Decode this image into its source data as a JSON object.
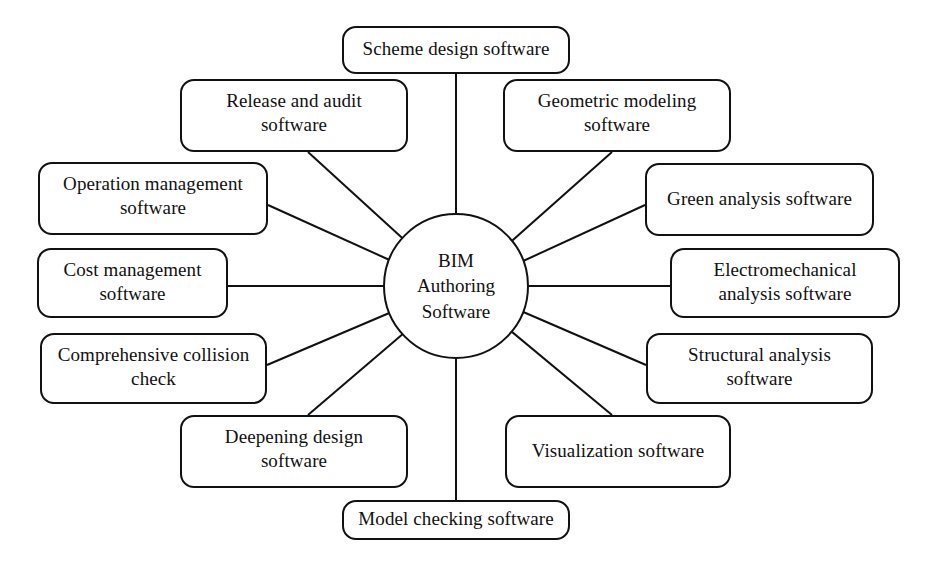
{
  "diagram": {
    "type": "hub-and-spoke",
    "title_shown": false,
    "background_color": "#ffffff",
    "stroke_color": "#111111",
    "text_color": "#111111",
    "center": {
      "label": "BIM\nAuthoring\nSoftware",
      "shape": "circle"
    },
    "nodes": [
      {
        "id": "scheme-design-software",
        "label": "Scheme design software",
        "lines": 1,
        "x": 342,
        "y": 26,
        "w": 228,
        "h": 48
      },
      {
        "id": "release-and-audit-software",
        "label": "Release and audit\nsoftware",
        "lines": 2,
        "x": 180,
        "y": 79,
        "w": 228,
        "h": 73
      },
      {
        "id": "geometric-modeling-software",
        "label": "Geometric modeling\nsoftware",
        "lines": 2,
        "x": 503,
        "y": 79,
        "w": 228,
        "h": 73
      },
      {
        "id": "operation-management-software",
        "label": "Operation management\nsoftware",
        "lines": 2,
        "x": 38,
        "y": 162,
        "w": 230,
        "h": 73
      },
      {
        "id": "green-analysis-software",
        "label": "Green analysis software",
        "lines": 1,
        "x": 645,
        "y": 163,
        "w": 229,
        "h": 73
      },
      {
        "id": "cost-management-software",
        "label": "Cost management\nsoftware",
        "lines": 2,
        "x": 37,
        "y": 248,
        "w": 191,
        "h": 70
      },
      {
        "id": "electromechanical-analysis-software",
        "label": "Electromechanical\nanalysis software",
        "lines": 2,
        "x": 670,
        "y": 248,
        "w": 230,
        "h": 70
      },
      {
        "id": "comprehensive-collision-check",
        "label": "Comprehensive collision\ncheck",
        "lines": 2,
        "x": 40,
        "y": 333,
        "w": 227,
        "h": 71
      },
      {
        "id": "structural-analysis-software",
        "label": "Structural analysis\nsoftware",
        "lines": 2,
        "x": 646,
        "y": 333,
        "w": 227,
        "h": 71
      },
      {
        "id": "deepening-design-software",
        "label": "Deepening design\nsoftware",
        "lines": 2,
        "x": 180,
        "y": 415,
        "w": 228,
        "h": 73
      },
      {
        "id": "visualization-software",
        "label": "Visualization software",
        "lines": 1,
        "x": 505,
        "y": 415,
        "w": 226,
        "h": 73
      },
      {
        "id": "model-checking-software",
        "label": "Model checking software",
        "lines": 1,
        "x": 342,
        "y": 500,
        "w": 228,
        "h": 40
      }
    ],
    "edges": [
      {
        "id": "edge-scheme-design-software",
        "x1": 456,
        "y1": 74,
        "x2": 456,
        "y2": 214
      },
      {
        "id": "edge-release-and-audit-software",
        "x1": 308,
        "y1": 152,
        "x2": 411,
        "y2": 246
      },
      {
        "id": "edge-geometric-modeling-software",
        "x1": 612,
        "y1": 152,
        "x2": 505,
        "y2": 247
      },
      {
        "id": "edge-operation-management-software",
        "x1": 268,
        "y1": 205,
        "x2": 394,
        "y2": 262
      },
      {
        "id": "edge-green-analysis-software",
        "x1": 645,
        "y1": 205,
        "x2": 521,
        "y2": 262
      },
      {
        "id": "edge-cost-management-software",
        "x1": 228,
        "y1": 286,
        "x2": 383,
        "y2": 286
      },
      {
        "id": "edge-electromechanical-analysis-software",
        "x1": 670,
        "y1": 286,
        "x2": 529,
        "y2": 286
      },
      {
        "id": "edge-comprehensive-collision-check",
        "x1": 267,
        "y1": 365,
        "x2": 394,
        "y2": 311
      },
      {
        "id": "edge-structural-analysis-software",
        "x1": 646,
        "y1": 365,
        "x2": 521,
        "y2": 311
      },
      {
        "id": "edge-deepening-design-software",
        "x1": 308,
        "y1": 415,
        "x2": 411,
        "y2": 327
      },
      {
        "id": "edge-visualization-software",
        "x1": 612,
        "y1": 415,
        "x2": 506,
        "y2": 327
      },
      {
        "id": "edge-model-checking-software",
        "x1": 456,
        "y1": 358,
        "x2": 456,
        "y2": 500
      }
    ]
  }
}
